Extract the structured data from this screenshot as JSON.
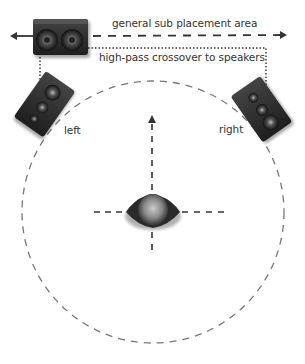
{
  "diagram": {
    "labels": {
      "sub_area": "general sub placement area",
      "crossover": "high-pass crossover to speakers",
      "left": "left",
      "right": "right"
    },
    "elements": {
      "subwoofer": "subwoofer-icon",
      "left_speaker": "left-speaker-icon",
      "right_speaker": "right-speaker-icon",
      "listener": "listener-head-icon",
      "listening_circle": "dashed-circle"
    },
    "colors": {
      "speaker": "#2b2b2b",
      "line": "#333333",
      "circle": "#777777",
      "text": "#333333"
    }
  }
}
